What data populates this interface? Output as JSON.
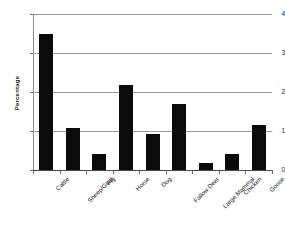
{
  "chart_data": {
    "type": "bar",
    "title": "",
    "xlabel": "",
    "ylabel": "Percentage",
    "categories": [
      "Cattle",
      "Sheep/Goat",
      "Pig",
      "Horse",
      "Dog",
      "Fallow Deer",
      "Large Mammal",
      "Chicken",
      "Goose"
    ],
    "values": [
      3.5,
      1.08,
      0.41,
      2.18,
      0.92,
      1.68,
      0.18,
      0.4,
      1.15
    ],
    "ylim": [
      0,
      4
    ],
    "yticks": [
      0,
      1,
      2,
      3,
      4
    ],
    "ytick_labels": [
      "0",
      "1",
      "2",
      "3",
      "4"
    ],
    "grid": true,
    "legend": false,
    "bar_color": "#0a0a0a",
    "grid_color": "#9a9a9a",
    "axis_color": "#4a4a4a",
    "background": "#ffffff"
  }
}
